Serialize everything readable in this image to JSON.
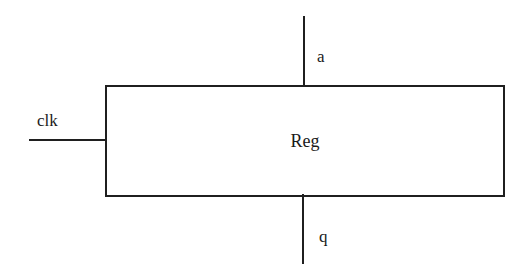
{
  "diagram": {
    "block": {
      "label": "Reg"
    },
    "ports": {
      "clk": {
        "label": "clk",
        "side": "left"
      },
      "a": {
        "label": "a",
        "side": "top"
      },
      "q": {
        "label": "q",
        "side": "bottom"
      }
    },
    "colors": {
      "stroke": "#1f1f1f",
      "text": "#1a1a1a",
      "background": "#ffffff"
    }
  }
}
